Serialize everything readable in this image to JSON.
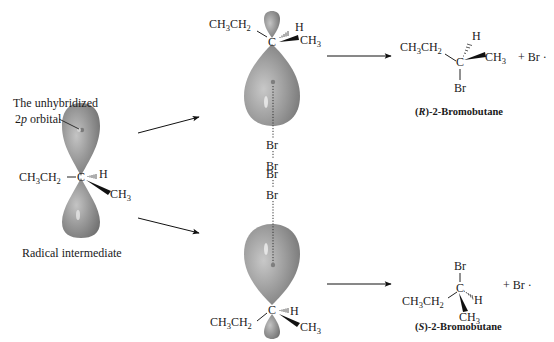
{
  "diagram": {
    "colors": {
      "orbital_dark": "#6f6f6f",
      "orbital_mid": "#9a9a9a",
      "orbital_light": "#c9c9c9",
      "ink": "#1a1a1a",
      "background": "#ffffff"
    },
    "left": {
      "orbital_label_line1": "The unhybridized",
      "orbital_label_2": "2",
      "orbital_label_p": "p",
      "orbital_label_rest": " orbital",
      "caption": "Radical intermediate",
      "ethyl": "CH",
      "ethyl_sub1": "3",
      "ethyl_mid": "CH",
      "ethyl_sub2": "2",
      "carbon": "C",
      "hydrogen": "H",
      "methyl": "CH",
      "methyl_sub": "3"
    },
    "top_attack": {
      "ethyl": "CH",
      "ethyl_sub1": "3",
      "ethyl_mid": "CH",
      "ethyl_sub2": "2",
      "carbon": "C",
      "hydrogen": "H",
      "methyl": "CH",
      "methyl_sub": "3",
      "br1": "Br",
      "br2": "Br"
    },
    "bottom_attack": {
      "br1": "Br",
      "br2": "Br",
      "ethyl": "CH",
      "ethyl_sub1": "3",
      "ethyl_mid": "CH",
      "ethyl_sub2": "2",
      "carbon": "C",
      "hydrogen": "H",
      "methyl": "CH",
      "methyl_sub": "3"
    },
    "product_r": {
      "ethyl": "CH",
      "ethyl_sub1": "3",
      "ethyl_mid": "CH",
      "ethyl_sub2": "2",
      "carbon": "C",
      "hydrogen": "H",
      "methyl": "CH",
      "methyl_sub": "3",
      "bromine": "Br",
      "byproduct": "+ Br ·",
      "name_open": "(",
      "name_config": "R",
      "name_rest": ")-2-Bromobutane"
    },
    "product_s": {
      "ethyl": "CH",
      "ethyl_sub1": "3",
      "ethyl_mid": "CH",
      "ethyl_sub2": "2",
      "carbon": "C",
      "hydrogen": "H",
      "methyl": "CH",
      "methyl_sub": "3",
      "bromine": "Br",
      "byproduct": "+ Br ·",
      "name_open": "(",
      "name_config": "S",
      "name_rest": ")-2-Bromobutane"
    }
  }
}
